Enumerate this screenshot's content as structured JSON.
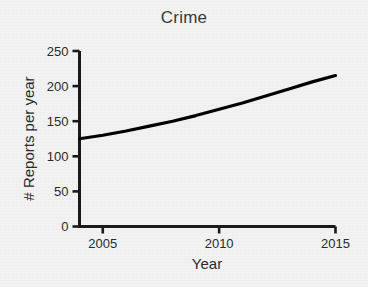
{
  "chart_data": {
    "type": "line",
    "title": "Crime",
    "xlabel": "Year",
    "ylabel": "# Reports per year",
    "x": [
      2004,
      2005,
      2006,
      2007,
      2008,
      2009,
      2010,
      2011,
      2012,
      2013,
      2014,
      2015
    ],
    "values": [
      125,
      130,
      136,
      143,
      150,
      158,
      167,
      176,
      186,
      196,
      206,
      215
    ],
    "series": [
      {
        "name": "Reports per year",
        "values": [
          125,
          130,
          136,
          143,
          150,
          158,
          167,
          176,
          186,
          196,
          206,
          215
        ]
      }
    ],
    "xlim": [
      2004,
      2015
    ],
    "ylim": [
      0,
      250
    ],
    "xticks": [
      2005,
      2010,
      2015
    ],
    "xtick_labels": [
      "2005",
      "2010",
      "2015"
    ],
    "yticks": [
      0,
      50,
      100,
      150,
      200,
      250
    ],
    "ytick_labels": [
      "0",
      "50",
      "100",
      "150",
      "200",
      "250"
    ],
    "grid": false,
    "legend": false,
    "legend_position": "none",
    "line_color": "#000000",
    "background_color": "#f2f2f2",
    "axis_color": "#1a1a1a"
  }
}
